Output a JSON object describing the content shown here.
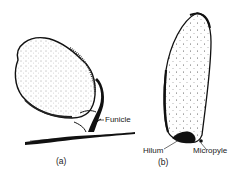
{
  "figure": {
    "panels": [
      {
        "id": "a",
        "caption": "(a)",
        "labels": [
          {
            "text": "Funicle"
          }
        ]
      },
      {
        "id": "b",
        "caption": "(b)",
        "labels": [
          {
            "text": "Hilum"
          },
          {
            "text": "Micropyle"
          }
        ]
      }
    ],
    "colors": {
      "ink": "#111111",
      "background": "#ffffff"
    }
  }
}
